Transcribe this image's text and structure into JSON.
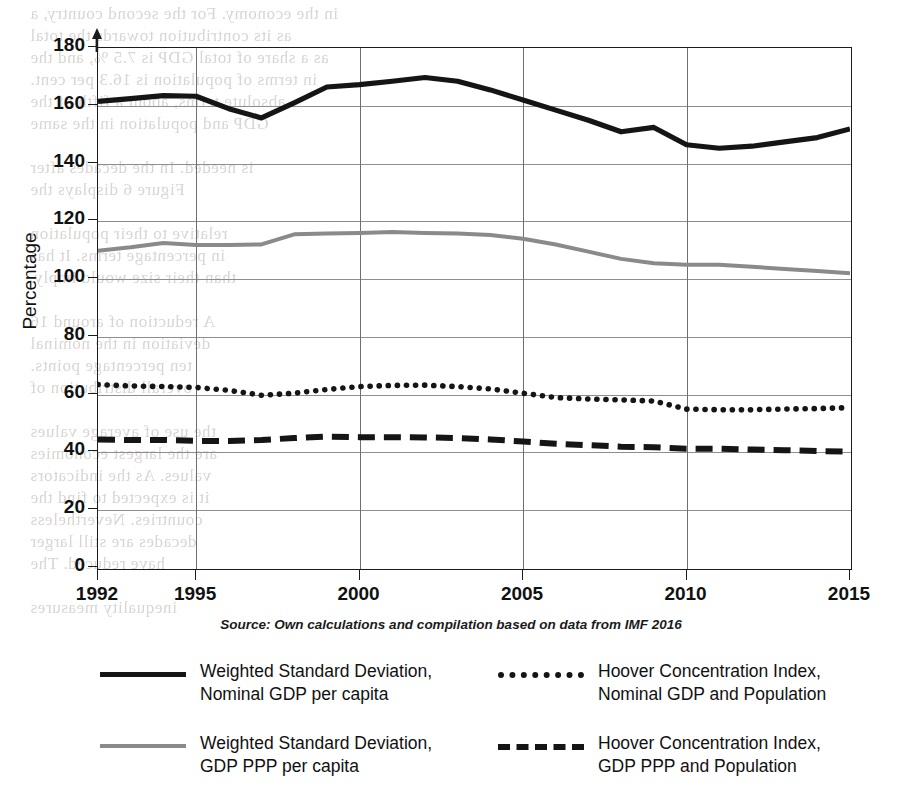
{
  "figure": {
    "source_note": "Source: Own calculations and compilation based on data from IMF 2016",
    "y_axis_title": "Percentage"
  },
  "legend": {
    "items": [
      {
        "id": "wsd-nominal",
        "style": "solid-black",
        "line1": "Weighted Standard Deviation,",
        "line2": "Nominal GDP per capita"
      },
      {
        "id": "hci-nominal",
        "style": "dotted",
        "line1": "Hoover Concentration Index,",
        "line2": "Nominal GDP and Population"
      },
      {
        "id": "wsd-ppp",
        "style": "solid-grey",
        "line1": "Weighted Standard Deviation,",
        "line2": "GDP PPP per capita"
      },
      {
        "id": "hci-ppp",
        "style": "dashed",
        "line1": "Hoover Concentration Index,",
        "line2": "GDP PPP and Population"
      }
    ]
  },
  "bleed_text": [
    {
      "x": 30,
      "y": 4,
      "t": "in the economy. For the second country, a"
    },
    {
      "x": 30,
      "y": 26,
      "t": "as its contribution towards the total"
    },
    {
      "x": 30,
      "y": 48,
      "t": "as a share of total GDP is 7.5 %, and the"
    },
    {
      "x": 30,
      "y": 70,
      "t": "in terms of population is 16.3 per cent."
    },
    {
      "x": 30,
      "y": 92,
      "t": "absolute terms, about a fifth of the"
    },
    {
      "x": 30,
      "y": 114,
      "t": "GDP and population in the same"
    },
    {
      "x": 30,
      "y": 158,
      "t": "is needed. In the decades after"
    },
    {
      "x": 30,
      "y": 180,
      "t": "Figure 6 displays the"
    },
    {
      "x": 30,
      "y": 224,
      "t": "relative to their population"
    },
    {
      "x": 30,
      "y": 246,
      "t": "in percentage terms. It has"
    },
    {
      "x": 30,
      "y": 268,
      "t": "than their size would imply."
    },
    {
      "x": 30,
      "y": 312,
      "t": "A reduction of around 16"
    },
    {
      "x": 30,
      "y": 334,
      "t": "deviation in the nominal"
    },
    {
      "x": 30,
      "y": 356,
      "t": "ten percentage points."
    },
    {
      "x": 30,
      "y": 378,
      "t": "overall distribution of"
    },
    {
      "x": 30,
      "y": 422,
      "t": "the use of average values"
    },
    {
      "x": 30,
      "y": 444,
      "t": "are the largest economies"
    },
    {
      "x": 30,
      "y": 466,
      "t": "values. As the indicators"
    },
    {
      "x": 30,
      "y": 488,
      "t": "it is expected to find the"
    },
    {
      "x": 30,
      "y": 510,
      "t": "countries. Nevertheless"
    },
    {
      "x": 30,
      "y": 532,
      "t": "decades are still larger"
    },
    {
      "x": 30,
      "y": 554,
      "t": "have reduced. The"
    },
    {
      "x": 30,
      "y": 598,
      "t": "inequality measures"
    }
  ],
  "chart_data": {
    "type": "line",
    "title": "",
    "xlabel": "",
    "ylabel": "Percentage",
    "xlim": [
      1992,
      2015
    ],
    "ylim": [
      0,
      180
    ],
    "ytick_step": 20,
    "yticks": [
      0,
      20,
      40,
      60,
      80,
      100,
      120,
      140,
      160,
      180
    ],
    "xticks": [
      1992,
      1995,
      2000,
      2005,
      2010,
      2015
    ],
    "grid": "horizontal-and-vertical",
    "legend_position": "below",
    "x": [
      1992,
      1993,
      1994,
      1995,
      1996,
      1997,
      1998,
      1999,
      2000,
      2001,
      2002,
      2003,
      2004,
      2005,
      2006,
      2007,
      2008,
      2009,
      2010,
      2011,
      2012,
      2013,
      2014,
      2015
    ],
    "series": [
      {
        "name": "Weighted Standard Deviation, Nominal GDP per capita",
        "style": "solid-black",
        "color": "#151515",
        "values": [
          161.5,
          162.5,
          163.5,
          163.3,
          159.0,
          155.8,
          161.0,
          166.5,
          167.3,
          168.5,
          169.8,
          168.5,
          165.5,
          162.0,
          158.5,
          155.0,
          151.0,
          152.5,
          146.5,
          145.3,
          146.0,
          147.5,
          149.0,
          152.0
        ]
      },
      {
        "name": "Weighted Standard Deviation, GDP PPP per capita",
        "style": "solid-grey",
        "color": "#8a8a8a",
        "values": [
          109.8,
          111.0,
          112.5,
          111.8,
          111.8,
          112.0,
          115.5,
          115.8,
          116.0,
          116.3,
          116.0,
          115.8,
          115.3,
          114.0,
          112.0,
          109.5,
          107.0,
          105.5,
          105.0,
          105.0,
          104.3,
          103.5,
          102.8,
          102.0
        ]
      },
      {
        "name": "Hoover Concentration Index, Nominal GDP and Population",
        "style": "dotted",
        "color": "#151515",
        "values": [
          63.5,
          63.0,
          62.8,
          62.5,
          61.5,
          59.8,
          60.5,
          61.8,
          62.8,
          63.2,
          63.3,
          62.8,
          62.0,
          60.5,
          59.0,
          58.5,
          58.2,
          57.8,
          55.0,
          54.8,
          54.8,
          55.0,
          55.2,
          55.5
        ]
      },
      {
        "name": "Hoover Concentration Index, GDP PPP and Population",
        "style": "dashed",
        "color": "#151515",
        "values": [
          44.5,
          44.3,
          44.3,
          44.0,
          44.0,
          44.3,
          45.0,
          45.5,
          45.3,
          45.3,
          45.2,
          45.0,
          44.5,
          43.8,
          43.0,
          42.5,
          42.0,
          41.8,
          41.3,
          41.3,
          41.0,
          40.8,
          40.5,
          40.3
        ]
      }
    ]
  }
}
